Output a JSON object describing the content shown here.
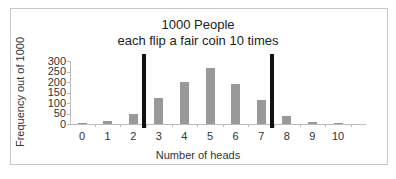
{
  "chart_data": {
    "type": "bar",
    "title": "1000 People",
    "subtitle": "each flip a fair coin 10 times",
    "xlabel": "Number of heads",
    "ylabel": "Frequency out of 1000",
    "categories": [
      "0",
      "1",
      "2",
      "3",
      "4",
      "5",
      "6",
      "7",
      "8",
      "9",
      "10"
    ],
    "values": [
      1,
      13,
      46,
      122,
      201,
      268,
      189,
      114,
      38,
      11,
      1
    ],
    "ylim": [
      0,
      300
    ],
    "yticks": [
      "300",
      "250",
      "200",
      "150",
      "100",
      "50",
      "0"
    ],
    "grid": false,
    "legend": null,
    "annotations": [
      {
        "type": "vertical-line",
        "position": "between 2 and 3",
        "color": "#111111"
      },
      {
        "type": "vertical-line",
        "position": "between 7 and 8",
        "color": "#111111"
      }
    ],
    "bar_color": "#999999"
  }
}
